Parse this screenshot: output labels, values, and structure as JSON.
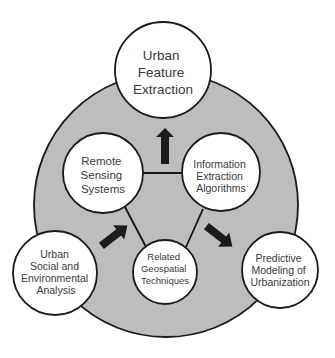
{
  "diagram": {
    "ring_color": "#bdbdbd",
    "nodes": {
      "top": {
        "lines": [
          "Urban",
          "Feature",
          "Extraction"
        ]
      },
      "remote_sensing": {
        "lines": [
          "Remote",
          "Sensing",
          "Systems"
        ]
      },
      "info_extraction": {
        "lines": [
          "Information",
          "Extraction",
          "Algorithms"
        ]
      },
      "related": {
        "lines": [
          "Related",
          "Geospatial",
          "Techniques"
        ]
      },
      "social": {
        "lines": [
          "Urban",
          "Social and",
          "Environmental",
          "Analysis"
        ]
      },
      "predictive": {
        "lines": [
          "Predictive",
          "Modeling of",
          "Urbanization"
        ]
      }
    },
    "arrows": [
      {
        "direction": "up",
        "to": "Urban Feature Extraction"
      },
      {
        "direction": "down-left",
        "to": "Urban Social and Environmental Analysis"
      },
      {
        "direction": "down-right",
        "to": "Predictive Modeling of Urbanization"
      }
    ],
    "connections": [
      [
        "Remote Sensing Systems",
        "Information Extraction Algorithms"
      ],
      [
        "Remote Sensing Systems",
        "Related Geospatial Techniques"
      ],
      [
        "Information Extraction Algorithms",
        "Related Geospatial Techniques"
      ]
    ]
  }
}
